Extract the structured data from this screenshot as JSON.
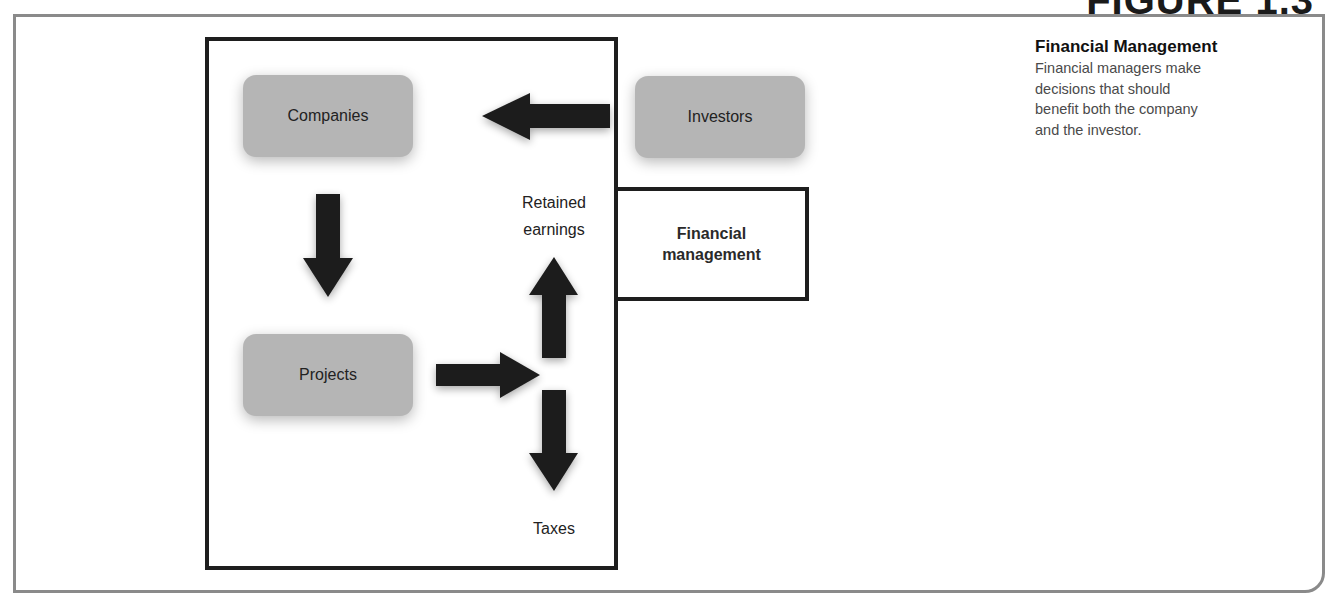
{
  "figure": {
    "title": "FIGURE 1.3"
  },
  "diagram": {
    "nodes": {
      "companies": "Companies",
      "investors": "Investors",
      "projects": "Projects"
    },
    "labels": {
      "retained_line1": "Retained",
      "retained_line2": "earnings",
      "taxes": "Taxes"
    },
    "financial_management_box": {
      "line1": "Financial",
      "line2": "management"
    },
    "arrows": [
      {
        "from": "Investors",
        "to": "Companies",
        "direction": "left"
      },
      {
        "from": "Companies",
        "to": "Projects",
        "direction": "down"
      },
      {
        "from": "Projects",
        "to": "split",
        "direction": "right"
      },
      {
        "from": "split",
        "to": "Retained earnings",
        "direction": "up"
      },
      {
        "from": "split",
        "to": "Taxes",
        "direction": "down"
      }
    ],
    "colors": {
      "node_fill": "#b5b5b5",
      "arrow_fill": "#1e1e1e",
      "frame_border": "#8a8a8a",
      "box_border": "#1e1e1e"
    }
  },
  "caption": {
    "title": "Financial Management",
    "body": "Financial managers make decisions that should benefit both the company and the investor."
  }
}
